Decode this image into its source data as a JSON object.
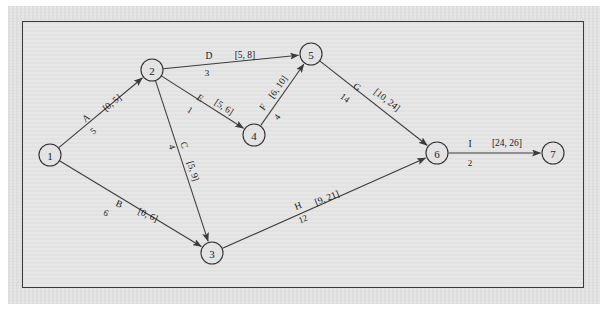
{
  "figure": {
    "kind": "activity-network-diagram",
    "background_color": "#e3e3e3",
    "paper_color": "#e4e4e4",
    "border_color": "#3a3a3a",
    "ink_color": "#2f2f2f"
  },
  "nodes": [
    {
      "id": "1",
      "label": "1",
      "cx": 50,
      "cy": 155,
      "r": 11
    },
    {
      "id": "2",
      "label": "2",
      "cx": 152,
      "cy": 70,
      "r": 11
    },
    {
      "id": "3",
      "label": "3",
      "cx": 212,
      "cy": 253,
      "r": 11
    },
    {
      "id": "4",
      "label": "4",
      "cx": 254,
      "cy": 135,
      "r": 11
    },
    {
      "id": "5",
      "label": "5",
      "cx": 311,
      "cy": 54,
      "r": 11
    },
    {
      "id": "6",
      "label": "6",
      "cx": 437,
      "cy": 153,
      "r": 11
    },
    {
      "id": "7",
      "label": "7",
      "cx": 553,
      "cy": 153,
      "r": 11
    }
  ],
  "edges": [
    {
      "id": "A",
      "name": "A",
      "interval": "[0, 5]",
      "weight": "5",
      "from": "1",
      "to": "2",
      "name_x": 86,
      "name_y": 118,
      "name_rot": -39,
      "interval_x": 112,
      "interval_y": 103,
      "interval_rot": -39,
      "weight_x": 93,
      "weight_y": 131,
      "weight_rot": -39
    },
    {
      "id": "B",
      "name": "B",
      "interval": "[0, 6]",
      "weight": "6",
      "from": "1",
      "to": "3",
      "name_x": 119,
      "name_y": 204,
      "name_rot": 24,
      "interval_x": 148,
      "interval_y": 215,
      "interval_rot": 24,
      "weight_x": 106,
      "weight_y": 213,
      "weight_rot": 24
    },
    {
      "id": "C",
      "name": "C",
      "interval": "[5, 9]",
      "weight": "4",
      "from": "2",
      "to": "3",
      "name_x": 184,
      "name_y": 145,
      "name_rot": 72,
      "interval_x": 193,
      "interval_y": 171,
      "interval_rot": 72,
      "weight_x": 172,
      "weight_y": 147,
      "weight_rot": 72
    },
    {
      "id": "D",
      "name": "D",
      "interval": "[5, 8]",
      "weight": "3",
      "from": "2",
      "to": "5",
      "name_x": 209,
      "name_y": 56,
      "name_rot": 0,
      "interval_x": 245,
      "interval_y": 55,
      "interval_rot": 0,
      "weight_x": 207,
      "weight_y": 73,
      "weight_rot": 0
    },
    {
      "id": "E",
      "name": "E",
      "interval": "[5, 6]",
      "weight": "1",
      "from": "2",
      "to": "4",
      "name_x": 200,
      "name_y": 98,
      "name_rot": 33,
      "interval_x": 224,
      "interval_y": 107,
      "interval_rot": 33,
      "weight_x": 190,
      "weight_y": 110,
      "weight_rot": 33
    },
    {
      "id": "F",
      "name": "F",
      "interval": "[6, 10]",
      "weight": "4",
      "from": "4",
      "to": "5",
      "name_x": 263,
      "name_y": 107,
      "name_rot": -55,
      "interval_x": 278,
      "interval_y": 87,
      "interval_rot": -55,
      "weight_x": 277,
      "weight_y": 117,
      "weight_rot": -55
    },
    {
      "id": "G",
      "name": "G",
      "interval": "[10, 24]",
      "weight": "14",
      "from": "5",
      "to": "6",
      "name_x": 357,
      "name_y": 87,
      "name_rot": 38,
      "interval_x": 387,
      "interval_y": 100,
      "interval_rot": 38,
      "weight_x": 345,
      "weight_y": 98,
      "weight_rot": 38
    },
    {
      "id": "H",
      "name": "H",
      "interval": "[9, 21]",
      "weight": "12",
      "from": "3",
      "to": "6",
      "name_x": 298,
      "name_y": 206,
      "name_rot": -22,
      "interval_x": 327,
      "interval_y": 198,
      "interval_rot": -22,
      "weight_x": 303,
      "weight_y": 219,
      "weight_rot": -22
    },
    {
      "id": "I",
      "name": "I",
      "interval": "[24, 26]",
      "weight": "2",
      "from": "6",
      "to": "7",
      "name_x": 470,
      "name_y": 144,
      "name_rot": 0,
      "interval_x": 507,
      "interval_y": 143,
      "interval_rot": 0,
      "weight_x": 470,
      "weight_y": 163,
      "weight_rot": 0
    }
  ]
}
